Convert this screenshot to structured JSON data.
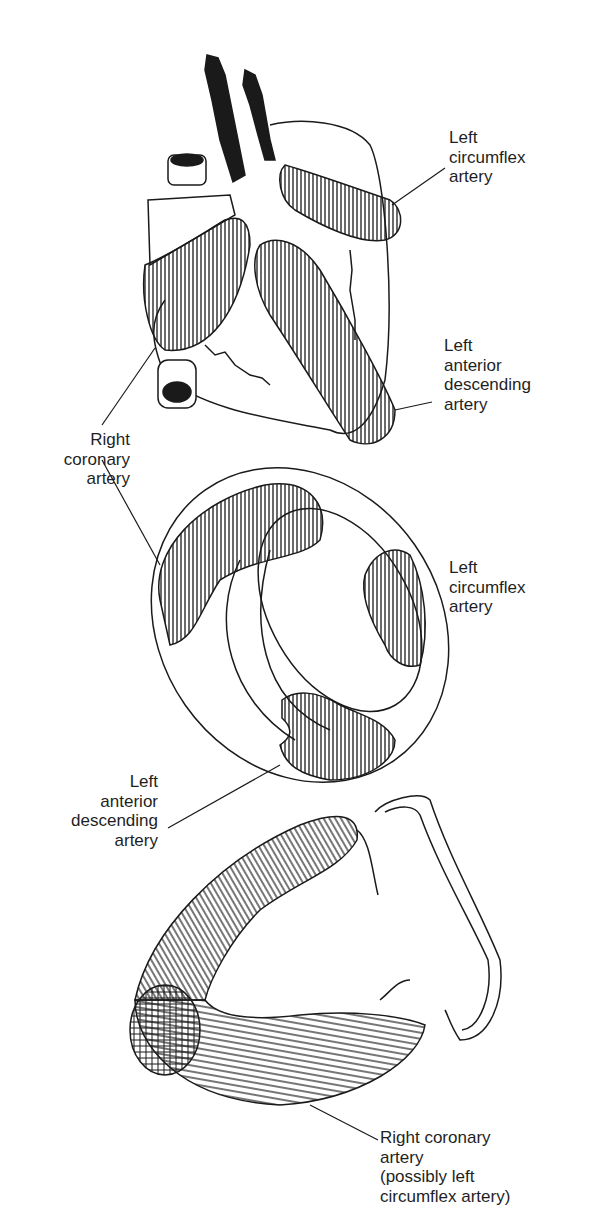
{
  "figure": {
    "panels": [
      {
        "id": "anterior-view",
        "description": "Anterior view of the heart",
        "labels": [
          {
            "key": "lcx",
            "text": "Left\ncircumflex\nartery"
          },
          {
            "key": "lad",
            "text": "Left\nanterior\ndescending\nartery"
          },
          {
            "key": "rca",
            "text": "Right\ncoronary\nartery"
          }
        ]
      },
      {
        "id": "cross-section",
        "description": "Short-axis cross section of the ventricles",
        "labels": [
          {
            "key": "lcx",
            "text": "Left\ncircumflex\nartery"
          },
          {
            "key": "lad",
            "text": "Left\nanterior\ndescending\nartery"
          }
        ]
      },
      {
        "id": "long-axis",
        "description": "Long-axis section of the left ventricle",
        "labels": [
          {
            "key": "rca",
            "text": "Right coronary\nartery\n(possibly left\ncircumflex artery)"
          }
        ]
      }
    ],
    "colors": {
      "ink": "#1a1a1a",
      "background": "#ffffff"
    }
  }
}
